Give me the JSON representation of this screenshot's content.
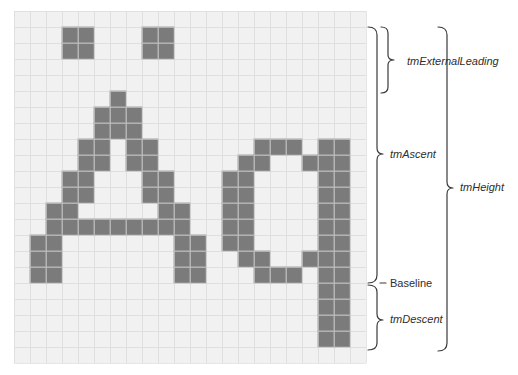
{
  "figure": {
    "glyphs": "Aq",
    "grid": {
      "cols": 22,
      "rows": 22,
      "cell_size": 16,
      "origin_x": 14,
      "origin_y": 11,
      "background": "#f1f1f1",
      "line_color": "#d2d2d2",
      "fill_color": "#7b7b7b",
      "fill_line_color": "#a3a3a3"
    },
    "filled_cells": [
      [
        1,
        3
      ],
      [
        1,
        4
      ],
      [
        1,
        8
      ],
      [
        1,
        9
      ],
      [
        2,
        3
      ],
      [
        2,
        4
      ],
      [
        2,
        8
      ],
      [
        2,
        9
      ],
      [
        5,
        6
      ],
      [
        6,
        5
      ],
      [
        6,
        6
      ],
      [
        6,
        7
      ],
      [
        7,
        5
      ],
      [
        7,
        6
      ],
      [
        7,
        7
      ],
      [
        8,
        4
      ],
      [
        8,
        5
      ],
      [
        8,
        7
      ],
      [
        8,
        8
      ],
      [
        8,
        15
      ],
      [
        8,
        16
      ],
      [
        8,
        17
      ],
      [
        8,
        19
      ],
      [
        8,
        20
      ],
      [
        9,
        4
      ],
      [
        9,
        5
      ],
      [
        9,
        7
      ],
      [
        9,
        8
      ],
      [
        9,
        14
      ],
      [
        9,
        15
      ],
      [
        9,
        18
      ],
      [
        9,
        19
      ],
      [
        9,
        20
      ],
      [
        10,
        3
      ],
      [
        10,
        4
      ],
      [
        10,
        8
      ],
      [
        10,
        9
      ],
      [
        10,
        13
      ],
      [
        10,
        14
      ],
      [
        10,
        19
      ],
      [
        10,
        20
      ],
      [
        11,
        3
      ],
      [
        11,
        4
      ],
      [
        11,
        8
      ],
      [
        11,
        9
      ],
      [
        11,
        13
      ],
      [
        11,
        14
      ],
      [
        11,
        19
      ],
      [
        11,
        20
      ],
      [
        12,
        2
      ],
      [
        12,
        3
      ],
      [
        12,
        9
      ],
      [
        12,
        10
      ],
      [
        12,
        13
      ],
      [
        12,
        14
      ],
      [
        12,
        19
      ],
      [
        12,
        20
      ],
      [
        13,
        2
      ],
      [
        13,
        3
      ],
      [
        13,
        4
      ],
      [
        13,
        5
      ],
      [
        13,
        6
      ],
      [
        13,
        7
      ],
      [
        13,
        8
      ],
      [
        13,
        9
      ],
      [
        13,
        10
      ],
      [
        13,
        13
      ],
      [
        13,
        14
      ],
      [
        13,
        19
      ],
      [
        13,
        20
      ],
      [
        14,
        1
      ],
      [
        14,
        2
      ],
      [
        14,
        10
      ],
      [
        14,
        11
      ],
      [
        14,
        13
      ],
      [
        14,
        14
      ],
      [
        14,
        19
      ],
      [
        14,
        20
      ],
      [
        15,
        1
      ],
      [
        15,
        2
      ],
      [
        15,
        10
      ],
      [
        15,
        11
      ],
      [
        15,
        14
      ],
      [
        15,
        15
      ],
      [
        15,
        18
      ],
      [
        15,
        19
      ],
      [
        15,
        20
      ],
      [
        16,
        1
      ],
      [
        16,
        2
      ],
      [
        16,
        10
      ],
      [
        16,
        11
      ],
      [
        16,
        15
      ],
      [
        16,
        16
      ],
      [
        16,
        17
      ],
      [
        16,
        19
      ],
      [
        16,
        20
      ],
      [
        17,
        19
      ],
      [
        17,
        20
      ],
      [
        18,
        19
      ],
      [
        18,
        20
      ],
      [
        19,
        19
      ],
      [
        19,
        20
      ],
      [
        20,
        19
      ],
      [
        20,
        20
      ]
    ],
    "labels": {
      "external_leading": "tmExternalLeading",
      "ascent": "tmAscent",
      "height": "tmHeight",
      "baseline": "Baseline",
      "descent": "tmDescent"
    },
    "text_color": "#2e2e2e",
    "brace_color": "#3a3a3a"
  }
}
